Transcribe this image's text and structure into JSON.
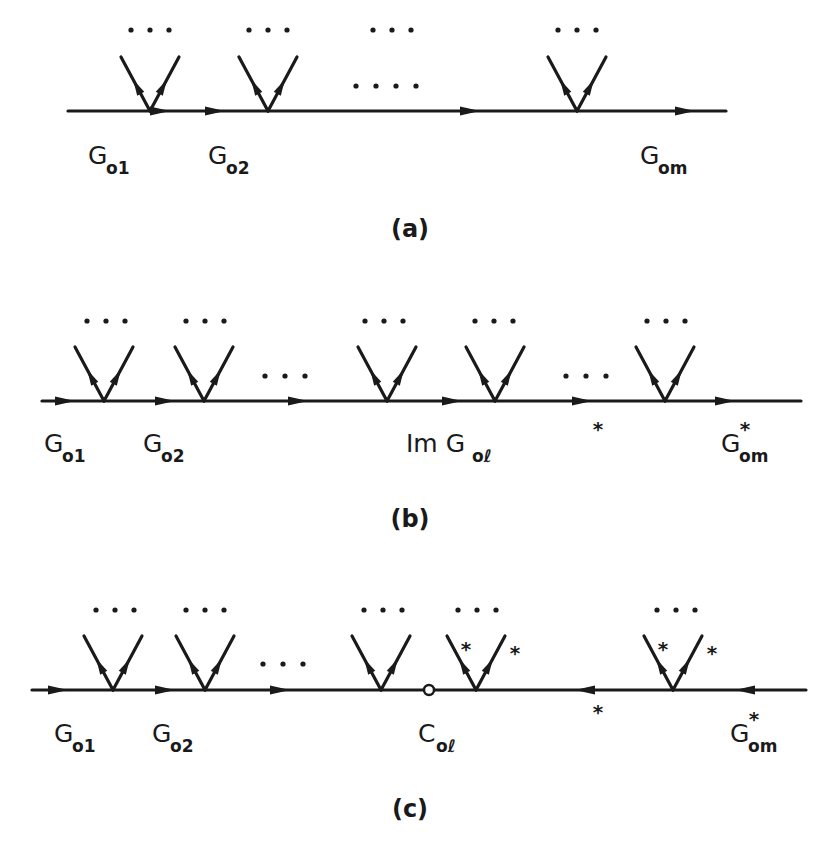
{
  "figure": {
    "panels": [
      {
        "id": "a",
        "caption": "(a)",
        "line_y": 111,
        "line_x": [
          68,
          726
        ],
        "arrows_right": [
          160,
          215,
          470,
          685
        ],
        "arrows_left": [],
        "vertices": [
          {
            "x": 150,
            "starred": false
          },
          {
            "x": 268,
            "starred": false
          },
          {
            "x": 577,
            "starred": false
          }
        ],
        "ellipsis_top": [
          {
            "x": 150,
            "y": 30
          },
          {
            "x": 268,
            "y": 30
          },
          {
            "x": 392,
            "y": 30
          },
          {
            "x": 577,
            "y": 30
          }
        ],
        "ellipsis_mid": [
          {
            "x": 386,
            "y": 86,
            "count": 4
          }
        ],
        "labels": [
          {
            "main": "G",
            "sub": "o1",
            "x": 88,
            "y": 164,
            "star": false
          },
          {
            "main": "G",
            "sub": "o2",
            "x": 208,
            "y": 164,
            "star": false
          },
          {
            "main": "G",
            "sub": "om",
            "x": 640,
            "y": 164,
            "star": false
          }
        ],
        "star_marks": []
      },
      {
        "id": "b",
        "caption": "(b)",
        "line_y": 401,
        "line_x": [
          42,
          801
        ],
        "arrows_right": [
          65,
          165,
          298,
          452,
          582,
          725
        ],
        "arrows_left": [],
        "vertices": [
          {
            "x": 104,
            "starred": false
          },
          {
            "x": 204,
            "starred": false
          },
          {
            "x": 387,
            "starred": false
          },
          {
            "x": 495,
            "starred": false
          },
          {
            "x": 665,
            "starred": false
          }
        ],
        "ellipsis_top": [
          {
            "x": 106,
            "y": 321
          },
          {
            "x": 205,
            "y": 321
          },
          {
            "x": 384,
            "y": 321
          },
          {
            "x": 494,
            "y": 321
          },
          {
            "x": 666,
            "y": 321
          }
        ],
        "ellipsis_mid": [
          {
            "x": 285,
            "y": 376,
            "count": 3
          },
          {
            "x": 586,
            "y": 376,
            "count": 3
          }
        ],
        "labels": [
          {
            "main": "G",
            "sub": "o1",
            "x": 44,
            "y": 452,
            "star": false
          },
          {
            "main": "G",
            "sub": "o2",
            "x": 143,
            "y": 452,
            "star": false
          },
          {
            "main": "Im G",
            "sub": "oℓ",
            "x": 406,
            "y": 452,
            "star": false
          },
          {
            "main": "G",
            "sub": "om",
            "x": 721,
            "y": 452,
            "star": true
          }
        ],
        "star_marks": [
          {
            "x": 598,
            "y": 428
          }
        ]
      },
      {
        "id": "c",
        "caption": "(c)",
        "line_y": 690,
        "line_x": [
          32,
          806
        ],
        "arrows_right": [
          58,
          165,
          280
        ],
        "arrows_left": [
          585,
          745
        ],
        "vertices": [
          {
            "x": 113,
            "starred": false
          },
          {
            "x": 205,
            "starred": false
          },
          {
            "x": 381,
            "starred": false
          },
          {
            "x": 476,
            "starred": true
          },
          {
            "x": 673,
            "starred": true
          }
        ],
        "open_circle": {
          "x": 429,
          "y": 690
        },
        "ellipsis_top": [
          {
            "x": 115,
            "y": 610
          },
          {
            "x": 205,
            "y": 610
          },
          {
            "x": 383,
            "y": 610
          },
          {
            "x": 477,
            "y": 610
          },
          {
            "x": 676,
            "y": 610
          }
        ],
        "ellipsis_mid": [
          {
            "x": 283,
            "y": 664,
            "count": 3
          }
        ],
        "labels": [
          {
            "main": "G",
            "sub": "o1",
            "x": 54,
            "y": 742,
            "star": false
          },
          {
            "main": "G",
            "sub": "o2",
            "x": 152,
            "y": 742,
            "star": false
          },
          {
            "main": "C",
            "sub": "oℓ",
            "x": 418,
            "y": 742,
            "star": false
          },
          {
            "main": "G",
            "sub": "om",
            "x": 730,
            "y": 742,
            "star": true
          }
        ],
        "star_marks": [
          {
            "x": 598,
            "y": 711
          }
        ]
      }
    ]
  },
  "captions": {
    "a": "(a)",
    "b": "(b)",
    "c": "(c)"
  }
}
